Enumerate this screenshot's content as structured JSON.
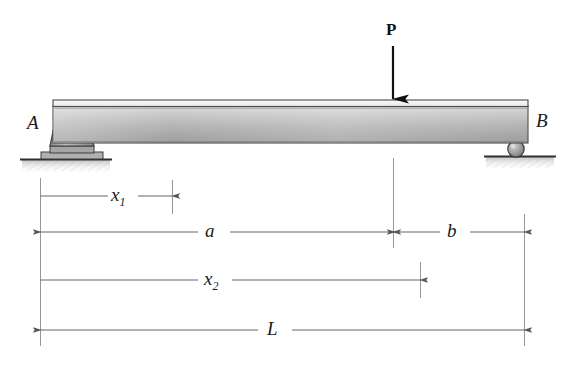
{
  "figure": {
    "background_color": "#ffffff"
  },
  "beam": {
    "label_left_support": "A",
    "label_right_support": "B",
    "fill_top_highlight": "#f2f2f2",
    "fill_body_light": "#dcdcdc",
    "fill_body_dark": "#8f8f8f",
    "outline_color": "#4a4a4a"
  },
  "load": {
    "symbol": "P",
    "direction": "down",
    "arrow_color": "#111111"
  },
  "supports": {
    "left": {
      "type": "pin",
      "name": "pin-support",
      "fill": "#a9a9a9",
      "outline": "#3d3d3d"
    },
    "right": {
      "type": "roller",
      "name": "roller-support",
      "fill": "#9c9c9c",
      "outline": "#3d3d3d"
    },
    "ground_color": "#2b2b2b",
    "hatch_color": "#cccccc"
  },
  "dimensions": [
    {
      "id": "x1",
      "label": "x",
      "subscript": "1",
      "style": "half-arrow-right"
    },
    {
      "id": "a",
      "label": "a",
      "subscript": "",
      "style": "double-arrow"
    },
    {
      "id": "b",
      "label": "b",
      "subscript": "",
      "style": "double-arrow"
    },
    {
      "id": "x2",
      "label": "x",
      "subscript": "2",
      "style": "half-arrow-right"
    },
    {
      "id": "L",
      "label": "L",
      "subscript": "",
      "style": "double-arrow"
    }
  ],
  "dimension_labels": {
    "x1_text": "x",
    "x1_sub": "1",
    "a_text": "a",
    "b_text": "b",
    "x2_text": "x",
    "x2_sub": "2",
    "L_text": "L"
  },
  "geometry": {
    "beam_left_x": 53,
    "beam_right_x": 528,
    "beam_top_y": 100,
    "beam_bottom_y": 143,
    "load_x": 393,
    "dim_x1_end": 172,
    "dim_x2_end": 420,
    "ground_y_left": 159,
    "ground_y_right": 156,
    "row_y_x1": 196,
    "row_y_ab": 232,
    "row_y_x2": 280,
    "row_y_L": 330
  },
  "colors": {
    "line": "#555555",
    "text": "#1a1a1a",
    "accent": "#111111"
  }
}
